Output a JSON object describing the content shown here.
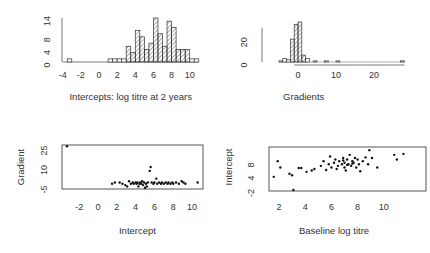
{
  "chart_data": [
    {
      "id": "intercepts-hist",
      "type": "bar",
      "title": "",
      "xlabel": "Intercepts: log titre at 2 years",
      "ylabel": "",
      "xlim": [
        -4,
        11
      ],
      "ylim": [
        0,
        14
      ],
      "xticks": [
        "-4",
        "-2",
        "0",
        "2",
        "4",
        "6",
        "8",
        "10"
      ],
      "yticks": [
        "0",
        "4",
        "8",
        "14"
      ],
      "bin_width": 0.5,
      "bins": [
        {
          "x0": -3.5,
          "count": 1
        },
        {
          "x0": 1.0,
          "count": 1
        },
        {
          "x0": 1.5,
          "count": 1
        },
        {
          "x0": 2.0,
          "count": 1
        },
        {
          "x0": 2.5,
          "count": 1
        },
        {
          "x0": 3.0,
          "count": 5
        },
        {
          "x0": 3.5,
          "count": 3
        },
        {
          "x0": 4.0,
          "count": 10
        },
        {
          "x0": 4.5,
          "count": 8
        },
        {
          "x0": 5.0,
          "count": 4
        },
        {
          "x0": 5.5,
          "count": 6
        },
        {
          "x0": 6.0,
          "count": 14
        },
        {
          "x0": 6.5,
          "count": 9
        },
        {
          "x0": 7.0,
          "count": 5
        },
        {
          "x0": 7.5,
          "count": 13
        },
        {
          "x0": 8.0,
          "count": 11
        },
        {
          "x0": 8.5,
          "count": 4
        },
        {
          "x0": 9.0,
          "count": 4
        },
        {
          "x0": 9.5,
          "count": 4
        },
        {
          "x0": 10.0,
          "count": 1
        },
        {
          "x0": 10.5,
          "count": 1
        }
      ],
      "fill": "diagonal-hatch",
      "grid": false
    },
    {
      "id": "gradients-hist",
      "type": "bar",
      "title": "",
      "xlabel": "Gradients",
      "ylabel": "",
      "xlim": [
        -5,
        28
      ],
      "ylim": [
        0,
        35
      ],
      "xticks": [
        "0",
        "10",
        "20"
      ],
      "yticks": [
        "0",
        "20"
      ],
      "bin_width": 1,
      "bins": [
        {
          "x0": -5,
          "count": 1
        },
        {
          "x0": -4,
          "count": 3
        },
        {
          "x0": -3,
          "count": 2
        },
        {
          "x0": -2,
          "count": 20
        },
        {
          "x0": -1,
          "count": 33
        },
        {
          "x0": 0,
          "count": 35
        },
        {
          "x0": 1,
          "count": 6
        },
        {
          "x0": 2,
          "count": 3
        },
        {
          "x0": 4,
          "count": 1
        },
        {
          "x0": 7,
          "count": 1
        },
        {
          "x0": 10,
          "count": 1
        },
        {
          "x0": 27,
          "count": 1
        }
      ],
      "fill": "diagonal-hatch",
      "grid": false
    },
    {
      "id": "gradient-vs-intercept",
      "type": "scatter",
      "title": "",
      "xlabel": "Intercept",
      "ylabel": "Gradient",
      "xlim": [
        -3.8,
        11
      ],
      "ylim": [
        -7,
        27
      ],
      "xticks": [
        "-2",
        "0",
        "2",
        "4",
        "6",
        "8",
        "10"
      ],
      "yticks": [
        "-5",
        "10",
        "25"
      ],
      "points": [
        [
          -3.3,
          26
        ],
        [
          1.5,
          -3
        ],
        [
          1.8,
          -2
        ],
        [
          2.3,
          -2
        ],
        [
          2.6,
          -3
        ],
        [
          2.9,
          -4
        ],
        [
          3.1,
          -5
        ],
        [
          3.3,
          -1
        ],
        [
          3.5,
          -3
        ],
        [
          3.7,
          -2
        ],
        [
          3.8,
          -3
        ],
        [
          4.0,
          -2
        ],
        [
          4.1,
          -3
        ],
        [
          4.2,
          -2
        ],
        [
          4.4,
          -3
        ],
        [
          4.5,
          -2
        ],
        [
          4.6,
          -3
        ],
        [
          4.7,
          -1
        ],
        [
          4.8,
          -4
        ],
        [
          4.9,
          -2
        ],
        [
          5.0,
          -6
        ],
        [
          5.1,
          -3
        ],
        [
          5.3,
          -2
        ],
        [
          5.5,
          7
        ],
        [
          5.6,
          10
        ],
        [
          5.7,
          -2
        ],
        [
          5.9,
          -3
        ],
        [
          6.0,
          -2
        ],
        [
          6.2,
          1
        ],
        [
          6.3,
          -3
        ],
        [
          6.5,
          -2
        ],
        [
          6.7,
          -3
        ],
        [
          6.8,
          -2
        ],
        [
          7.0,
          -3
        ],
        [
          7.2,
          -2
        ],
        [
          7.4,
          -3
        ],
        [
          7.5,
          -2
        ],
        [
          7.7,
          -3
        ],
        [
          7.9,
          -2
        ],
        [
          8.0,
          -3
        ],
        [
          8.3,
          -2
        ],
        [
          8.6,
          -3
        ],
        [
          8.9,
          -1
        ],
        [
          9.1,
          -2
        ],
        [
          9.3,
          -3
        ],
        [
          10.6,
          -2
        ],
        [
          4.3,
          -5
        ],
        [
          5.2,
          -5
        ]
      ],
      "grid": false
    },
    {
      "id": "intercept-vs-baseline",
      "type": "scatter",
      "title": "",
      "xlabel": "Baseline log titre",
      "ylabel": "Intercept",
      "xlim": [
        1.4,
        11.8
      ],
      "ylim": [
        -3.5,
        10.5
      ],
      "xticks": [
        "2",
        "4",
        "6",
        "8",
        "10"
      ],
      "yticks": [
        "-2",
        "4",
        "8"
      ],
      "points": [
        [
          1.6,
          1.0
        ],
        [
          1.9,
          6.0
        ],
        [
          2.1,
          4.0
        ],
        [
          2.8,
          2.0
        ],
        [
          3.0,
          1.5
        ],
        [
          3.1,
          -3.2
        ],
        [
          3.5,
          3.8
        ],
        [
          3.7,
          3.8
        ],
        [
          4.1,
          2.6
        ],
        [
          4.5,
          3.0
        ],
        [
          4.7,
          3.5
        ],
        [
          5.2,
          4.5
        ],
        [
          5.4,
          6.0
        ],
        [
          5.6,
          3.2
        ],
        [
          5.8,
          5.0
        ],
        [
          5.9,
          7.5
        ],
        [
          6.0,
          4.0
        ],
        [
          6.2,
          5.5
        ],
        [
          6.3,
          6.5
        ],
        [
          6.5,
          4.5
        ],
        [
          6.6,
          6.0
        ],
        [
          6.8,
          5.0
        ],
        [
          6.9,
          7.0
        ],
        [
          7.0,
          5.5
        ],
        [
          7.0,
          4.0
        ],
        [
          7.1,
          3.0
        ],
        [
          7.2,
          6.5
        ],
        [
          7.3,
          5.0
        ],
        [
          7.4,
          8.0
        ],
        [
          7.5,
          4.5
        ],
        [
          7.6,
          6.0
        ],
        [
          7.7,
          5.5
        ],
        [
          7.8,
          7.0
        ],
        [
          7.9,
          4.0
        ],
        [
          8.0,
          6.5
        ],
        [
          8.1,
          5.0
        ],
        [
          8.2,
          2.8
        ],
        [
          8.4,
          6.0
        ],
        [
          8.6,
          7.2
        ],
        [
          8.8,
          5.0
        ],
        [
          8.9,
          9.5
        ],
        [
          9.1,
          7.0
        ],
        [
          9.5,
          4.0
        ],
        [
          6.4,
          3.5
        ],
        [
          7.2,
          4.8
        ],
        [
          7.6,
          5.2
        ],
        [
          6.9,
          6.2
        ],
        [
          10.8,
          8.0
        ],
        [
          11.0,
          6.5
        ],
        [
          11.5,
          8.3
        ]
      ],
      "grid": false
    }
  ]
}
